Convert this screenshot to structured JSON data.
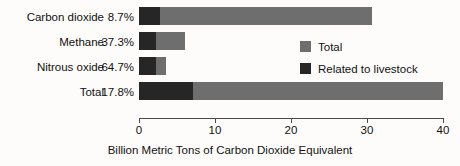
{
  "chart_data": {
    "type": "bar",
    "orientation": "horizontal",
    "stacked": true,
    "title": "",
    "xlabel": "Billion Metric Tons of Carbon Dioxide Equivalent",
    "ylabel": "",
    "xlim": [
      0,
      40
    ],
    "xticks": [
      0,
      10,
      20,
      30,
      40
    ],
    "xtick_labels": [
      "0",
      "10",
      "20",
      "30",
      "40"
    ],
    "grid": false,
    "legend_position": "inside-right",
    "categories": [
      "Carbon dioxide",
      "Methane",
      "Nitrous oxide",
      "Total"
    ],
    "percent_labels": [
      "8.7%",
      "37.3%",
      "64.7%",
      "17.8%"
    ],
    "series": [
      {
        "name": "Total",
        "color": "#6e6e6e",
        "values": [
          30.7,
          6.1,
          3.6,
          40.0
        ]
      },
      {
        "name": "Related to livestock",
        "color": "#262626",
        "values": [
          2.7,
          2.3,
          2.3,
          7.1
        ]
      }
    ],
    "rows": [
      {
        "category": "Carbon dioxide",
        "percent": "8.7%",
        "total": 30.7,
        "livestock": 2.7
      },
      {
        "category": "Methane",
        "percent": "37.3%",
        "total": 6.1,
        "livestock": 2.3
      },
      {
        "category": "Nitrous oxide",
        "percent": "64.7%",
        "total": 3.6,
        "livestock": 2.3
      },
      {
        "category": "Total",
        "percent": "17.8%",
        "total": 40.0,
        "livestock": 7.1
      }
    ]
  },
  "legend": {
    "items": [
      {
        "label": "Total",
        "color": "#6e6e6e"
      },
      {
        "label": "Related to livestock",
        "color": "#262626"
      }
    ]
  },
  "axis": {
    "title": "Billion Metric Tons of Carbon Dioxide Equivalent",
    "tick_labels": [
      "0",
      "10",
      "20",
      "30",
      "40"
    ]
  },
  "colors": {
    "total": "#6e6e6e",
    "livestock": "#262626",
    "axis": "#4a4a4a",
    "background": "#fdfcfa",
    "text": "#111111"
  }
}
